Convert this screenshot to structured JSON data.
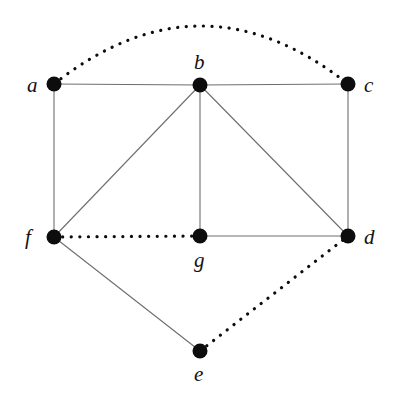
{
  "figure": {
    "type": "undirected-graph-diagram",
    "background_color": "#ffffff",
    "width": 396,
    "height": 401,
    "vertex_color": "#0d0d0d",
    "solid_edge_color": "#6e6e6e",
    "dotted_edge_color": "#0d0d0d",
    "vertex_radius": 7.5,
    "solid_edge_width": 1.1,
    "dotted_edge_width": 3.2
  },
  "vertices": [
    {
      "id": "a",
      "label": "a",
      "x": 54,
      "y": 84,
      "label_x": 27,
      "label_y": 75,
      "label_position": "left"
    },
    {
      "id": "b",
      "label": "b",
      "x": 200,
      "y": 85,
      "label_x": 194,
      "label_y": 52,
      "label_position": "above"
    },
    {
      "id": "c",
      "label": "c",
      "x": 348,
      "y": 84,
      "label_x": 364,
      "label_y": 75,
      "label_position": "right"
    },
    {
      "id": "d",
      "label": "d",
      "x": 348,
      "y": 236,
      "label_x": 364,
      "label_y": 227,
      "label_position": "right"
    },
    {
      "id": "e",
      "label": "e",
      "x": 200,
      "y": 351,
      "label_x": 194,
      "label_y": 364,
      "label_position": "below"
    },
    {
      "id": "f",
      "label": "f",
      "x": 54,
      "y": 237,
      "label_x": 25,
      "label_y": 227,
      "label_position": "left"
    },
    {
      "id": "g",
      "label": "g",
      "x": 200,
      "y": 236,
      "label_x": 194,
      "label_y": 250,
      "label_position": "below"
    }
  ],
  "edges": [
    {
      "id": "edge-a-c",
      "from": "a",
      "to": "c",
      "style": "dotted",
      "shape": "arc",
      "arc_peak_y": 26
    },
    {
      "id": "edge-a-b",
      "from": "a",
      "to": "b",
      "style": "solid",
      "shape": "straight"
    },
    {
      "id": "edge-b-c",
      "from": "b",
      "to": "c",
      "style": "solid",
      "shape": "straight"
    },
    {
      "id": "edge-a-f",
      "from": "a",
      "to": "f",
      "style": "solid",
      "shape": "straight"
    },
    {
      "id": "edge-c-d",
      "from": "c",
      "to": "d",
      "style": "solid",
      "shape": "straight"
    },
    {
      "id": "edge-b-f",
      "from": "b",
      "to": "f",
      "style": "solid",
      "shape": "straight"
    },
    {
      "id": "edge-b-g",
      "from": "b",
      "to": "g",
      "style": "solid",
      "shape": "straight"
    },
    {
      "id": "edge-b-d",
      "from": "b",
      "to": "d",
      "style": "solid",
      "shape": "straight"
    },
    {
      "id": "edge-f-g",
      "from": "f",
      "to": "g",
      "style": "dotted",
      "shape": "straight"
    },
    {
      "id": "edge-g-d",
      "from": "g",
      "to": "d",
      "style": "solid",
      "shape": "straight"
    },
    {
      "id": "edge-f-e",
      "from": "f",
      "to": "e",
      "style": "solid",
      "shape": "straight"
    },
    {
      "id": "edge-e-d",
      "from": "e",
      "to": "d",
      "style": "dotted",
      "shape": "straight"
    }
  ]
}
